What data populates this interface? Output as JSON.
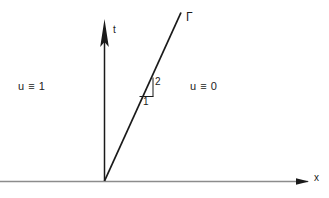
{
  "figure": {
    "background_color": "#ffffff",
    "width": 329,
    "height": 198
  },
  "axes": {
    "x_axis": {
      "label": "x",
      "color": "#8c8c8c",
      "arrow_color": "#1a1a1a",
      "y_position": 181,
      "x_start": 0,
      "x_end": 312
    },
    "t_axis": {
      "label": "t",
      "color": "#1a1a1a",
      "x_position": 104,
      "y_start": 181,
      "y_end": 18
    }
  },
  "curve": {
    "label": "Γ",
    "color": "#1a1a1a",
    "x_start": 104,
    "y_start": 181,
    "x_end": 181,
    "y_end": 12,
    "slope": 2
  },
  "slope_triangle": {
    "rise_label": "2",
    "run_label": "1",
    "color": "#1a1a1a",
    "base_left_x": 140,
    "base_y": 96,
    "right_x": 153,
    "top_y": 78
  },
  "regions": {
    "left": {
      "label": "u ≡ 1",
      "value": "1",
      "color": "#232323"
    },
    "right": {
      "label": "u ≡ 0",
      "value": "0",
      "color": "#232323"
    }
  }
}
